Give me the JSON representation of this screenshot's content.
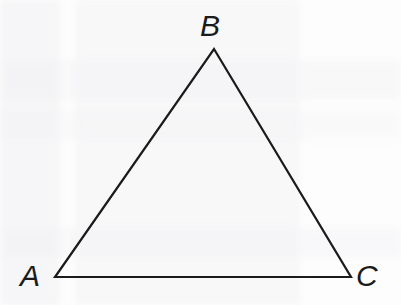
{
  "figure": {
    "background_color": "#fdfdfd",
    "stroke_color": "#1b1b1b",
    "stroke_width": 2.2,
    "label_color": "#1b1b1b",
    "label_font_size": 30,
    "label_style": "italic"
  },
  "chart_data": {
    "type": "diagram",
    "shape": "triangle",
    "vertices": [
      {
        "label": "A",
        "x": 55,
        "y": 277,
        "label_x": 20,
        "label_y": 261
      },
      {
        "label": "B",
        "x": 214,
        "y": 49,
        "label_x": 200,
        "label_y": 11
      },
      {
        "label": "C",
        "x": 351,
        "y": 277,
        "label_x": 356,
        "label_y": 261
      }
    ],
    "edges": [
      {
        "from": "A",
        "to": "B"
      },
      {
        "from": "B",
        "to": "C"
      },
      {
        "from": "C",
        "to": "A"
      }
    ],
    "xlim": [
      0,
      401
    ],
    "ylim": [
      0,
      305
    ],
    "grid": false,
    "legend": null,
    "annotations": []
  },
  "labels": {
    "a": "A",
    "b": "B",
    "c": "C"
  }
}
